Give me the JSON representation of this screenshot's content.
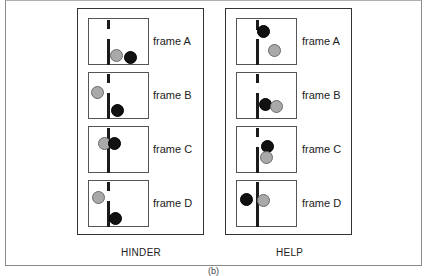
{
  "figure": {
    "sublabel": "(b)",
    "colors": {
      "grey_ball": "#a9a9a9",
      "black_ball": "#111111",
      "barrier": "#1a1a1a",
      "border": "#333333"
    }
  },
  "panels": [
    {
      "caption": "HINDER",
      "frames": [
        {
          "label": "frame A",
          "grey": {
            "x": 21,
            "y": 30
          },
          "black": {
            "x": 35,
            "y": 32
          }
        },
        {
          "label": "frame B",
          "grey": {
            "x": 2,
            "y": 13
          },
          "black": {
            "x": 22,
            "y": 31
          }
        },
        {
          "label": "frame C",
          "grey": {
            "x": 9,
            "y": 10
          },
          "black": {
            "x": 19,
            "y": 10
          }
        },
        {
          "label": "frame D",
          "grey": {
            "x": 3,
            "y": 10
          },
          "black": {
            "x": 20,
            "y": 31
          }
        }
      ]
    },
    {
      "caption": "HELP",
      "frames": [
        {
          "label": "frame A",
          "grey": {
            "x": 31,
            "y": 25
          },
          "black": {
            "x": 20,
            "y": 6
          }
        },
        {
          "label": "frame B",
          "grey": {
            "x": 33,
            "y": 27
          },
          "black": {
            "x": 22,
            "y": 25
          }
        },
        {
          "label": "frame C",
          "grey": {
            "x": 23,
            "y": 24
          },
          "black": {
            "x": 24,
            "y": 13
          }
        },
        {
          "label": "frame D",
          "grey": {
            "x": 20,
            "y": 13
          },
          "black": {
            "x": 3,
            "y": 12
          }
        }
      ]
    }
  ]
}
